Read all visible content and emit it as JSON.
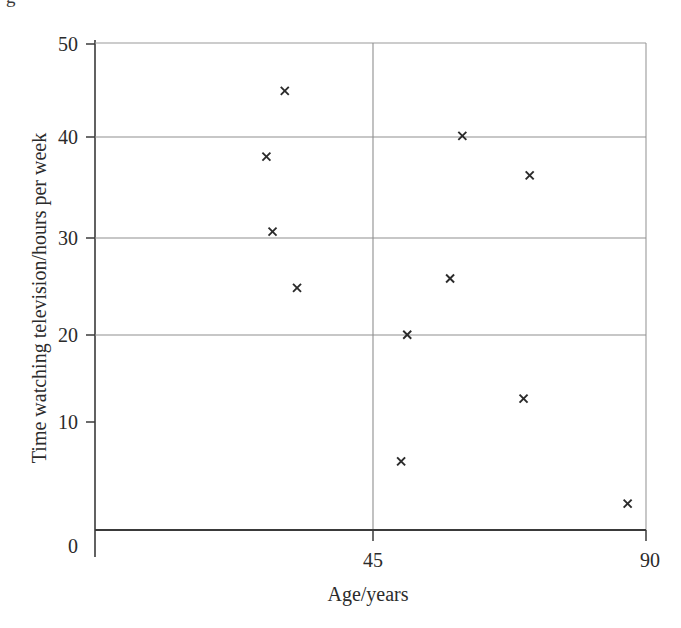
{
  "figure": {
    "cropped_caption_fragment": "g",
    "background_color": "#ffffff",
    "marker_color": "#2a2a2a",
    "grid_color": "#8f8f8f",
    "axis_color": "#3a3a3a"
  },
  "chart_data": {
    "type": "scatter",
    "title": "",
    "xlabel": "Age/years",
    "ylabel": "Time watching television/hours per week",
    "xlim": [
      0,
      90
    ],
    "ylim": [
      0,
      50
    ],
    "xticks": [
      "0",
      "45",
      "90"
    ],
    "xtick_values": [
      0,
      45,
      90
    ],
    "yticks": [
      "0",
      "10",
      "20",
      "30",
      "40",
      "50"
    ],
    "ytick_values": [
      0,
      10,
      20,
      30,
      40,
      50
    ],
    "grid": "horizontal gridlines at 20, 30, 40, 50 and vertical gridline at 45",
    "legend": "none",
    "marker_style": "x",
    "n_points": 11,
    "points": [
      {
        "x": 31,
        "y": 45
      },
      {
        "x": 28,
        "y": 38
      },
      {
        "x": 29,
        "y": 30
      },
      {
        "x": 33,
        "y": 24
      },
      {
        "x": 60,
        "y": 40.2
      },
      {
        "x": 71,
        "y": 36
      },
      {
        "x": 58,
        "y": 25
      },
      {
        "x": 51,
        "y": 19
      },
      {
        "x": 70,
        "y": 12.2
      },
      {
        "x": 50,
        "y": 5.5
      },
      {
        "x": 87,
        "y": 1
      }
    ],
    "x_values": [
      31,
      28,
      29,
      33,
      60,
      71,
      58,
      51,
      70,
      50,
      87
    ],
    "y_values": [
      45,
      38,
      30,
      24,
      40.2,
      36,
      25,
      19,
      12.2,
      5.5,
      1
    ]
  },
  "labels": {
    "x_axis_title": "Age/years",
    "y_axis_title": "Time watching television/hours per week",
    "x_tick_0": "0",
    "x_tick_45": "45",
    "x_tick_90": "90",
    "y_tick_0": "0",
    "y_tick_10": "10",
    "y_tick_20": "20",
    "y_tick_30": "30",
    "y_tick_40": "40",
    "y_tick_50": "50"
  }
}
